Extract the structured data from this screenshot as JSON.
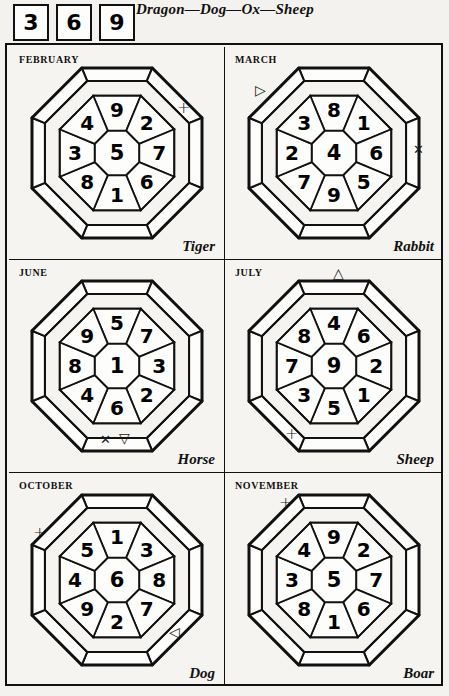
{
  "header": {
    "boxes": [
      "3",
      "6",
      "9"
    ],
    "title": "Dragon—Dog—Ox—Sheep"
  },
  "cells": [
    {
      "month": "FEBRUARY",
      "animal": "Tiger",
      "center": "5",
      "ring": {
        "n": "9",
        "ne": "2",
        "e": "7",
        "se": "6",
        "s": "1",
        "sw": "8",
        "w": "3",
        "nw": "4"
      },
      "markers": [
        {
          "name": "plus-marker",
          "glyph": "+",
          "kind": "plus",
          "left": "168px",
          "top": "53px"
        }
      ]
    },
    {
      "month": "MARCH",
      "animal": "Rabbit",
      "center": "4",
      "ring": {
        "n": "8",
        "ne": "1",
        "e": "6",
        "se": "5",
        "s": "9",
        "sw": "7",
        "w": "2",
        "nw": "3"
      },
      "markers": [
        {
          "name": "triangle-right-marker",
          "glyph": "▷",
          "kind": "tri",
          "left": "30px",
          "top": "36px"
        },
        {
          "name": "cross-marker",
          "glyph": "✕",
          "kind": "cross",
          "left": "188px",
          "top": "96px"
        }
      ]
    },
    {
      "month": "JUNE",
      "animal": "Horse",
      "center": "1",
      "ring": {
        "n": "5",
        "ne": "7",
        "e": "3",
        "se": "2",
        "s": "6",
        "sw": "4",
        "w": "8",
        "nw": "9"
      },
      "markers": [
        {
          "name": "cross-marker",
          "glyph": "✕",
          "kind": "cross",
          "left": "91px",
          "top": "173px"
        },
        {
          "name": "triangle-down-marker",
          "glyph": "▽",
          "kind": "tri",
          "left": "110px",
          "top": "171px"
        }
      ]
    },
    {
      "month": "JULY",
      "animal": "Sheep",
      "center": "9",
      "ring": {
        "n": "4",
        "ne": "6",
        "e": "2",
        "se": "1",
        "s": "5",
        "sw": "3",
        "w": "7",
        "nw": "8"
      },
      "markers": [
        {
          "name": "triangle-up-marker",
          "glyph": "△",
          "kind": "tri",
          "left": "108px",
          "top": "6px"
        },
        {
          "name": "plus-marker",
          "glyph": "+",
          "kind": "plus",
          "left": "60px",
          "top": "166px"
        }
      ]
    },
    {
      "month": "OCTOBER",
      "animal": "Dog",
      "center": "6",
      "ring": {
        "n": "1",
        "ne": "3",
        "e": "8",
        "se": "7",
        "s": "2",
        "sw": "9",
        "w": "4",
        "nw": "5"
      },
      "markers": [
        {
          "name": "plus-marker",
          "glyph": "+",
          "kind": "plus",
          "left": "24px",
          "top": "52px"
        },
        {
          "name": "triangle-right-marker",
          "glyph": "◁",
          "kind": "tri",
          "left": "160px",
          "top": "152px"
        }
      ]
    },
    {
      "month": "NOVEMBER",
      "animal": "Boar",
      "center": "5",
      "ring": {
        "n": "9",
        "ne": "2",
        "e": "7",
        "se": "6",
        "s": "1",
        "sw": "8",
        "w": "3",
        "nw": "4"
      },
      "markers": [
        {
          "name": "plus-marker",
          "glyph": "+",
          "kind": "plus",
          "left": "54px",
          "top": "22px"
        }
      ]
    }
  ],
  "colors": {
    "ink": "#111111",
    "paper": "#f4f2ee"
  }
}
